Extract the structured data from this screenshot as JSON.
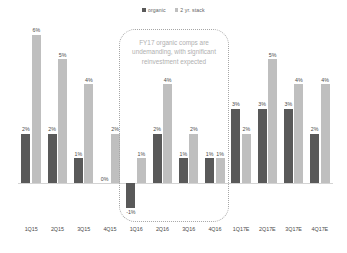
{
  "legend": {
    "position": "top-center",
    "entries": [
      {
        "label": "organic",
        "color": "#595959",
        "icon": "square-marker"
      },
      {
        "label": "2 yr. stack",
        "color": "#bfbfbf",
        "icon": "square-marker"
      }
    ]
  },
  "annotation": {
    "text": "FY17 organic comps are undemanding, with significant reinvestment expected",
    "border_style": "dotted",
    "border_color": "#a6a6a6",
    "text_color": "#b0b0b0",
    "covers": [
      "1Q16",
      "2Q16",
      "3Q16",
      "4Q16"
    ]
  },
  "colors": {
    "organic": "#595959",
    "two_yr_stack": "#bfbfbf",
    "baseline": "#d4d4d4",
    "label_text": "#4a4a4a",
    "background": "#ffffff"
  },
  "chart_data": {
    "type": "bar",
    "title": "",
    "subtitle": "",
    "xlabel": "",
    "ylabel": "",
    "ylim": [
      -1,
      6
    ],
    "grid": false,
    "legend_position": "top-center",
    "categories": [
      "1Q15",
      "2Q15",
      "3Q15",
      "4Q15",
      "1Q16",
      "2Q16",
      "3Q16",
      "4Q16",
      "1Q17E",
      "2Q17E",
      "3Q17E",
      "4Q17E"
    ],
    "series": [
      {
        "name": "organic",
        "color": "#595959",
        "values": [
          2,
          2,
          1,
          0,
          -1,
          2,
          1,
          1,
          3,
          3,
          3,
          2
        ],
        "labels": [
          "2%",
          "2%",
          "1%",
          "0%",
          "-1%",
          "2%",
          "1%",
          "1%",
          "3%",
          "3%",
          "3%",
          "2%"
        ]
      },
      {
        "name": "2 yr. stack",
        "color": "#bfbfbf",
        "values": [
          6,
          5,
          4,
          2,
          1,
          4,
          2,
          1,
          2,
          5,
          4,
          4
        ],
        "labels": [
          "6%",
          "5%",
          "4%",
          "2%",
          "1%",
          "4%",
          "2%",
          "1%",
          "2%",
          "5%",
          "4%",
          "4%"
        ]
      }
    ],
    "annotations": [
      {
        "text": "FY17 organic comps are undemanding, with significant reinvestment expected",
        "span": [
          "1Q16",
          "4Q16"
        ]
      }
    ]
  }
}
